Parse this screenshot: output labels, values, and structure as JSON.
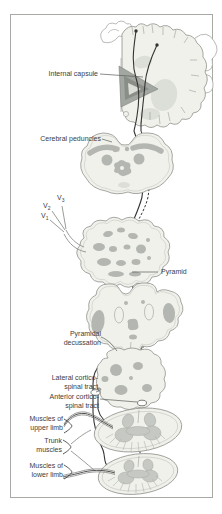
{
  "labels": {
    "internal_capsule": "Internal capsule",
    "cerebral_peduncles": "Cerebral peduncles",
    "pyramid": "Pyramid",
    "pyramidal_decussation": [
      "Pyramidal",
      "decussation"
    ],
    "lateral_corticospinal_tract": [
      "Lateral cortico-",
      "spinal tract"
    ],
    "anterior_corticospinal_tract": [
      "Anterior cortico-",
      "spinal tract"
    ],
    "muscles_upper_limb": [
      "Muscles of",
      "upper limb"
    ],
    "trunk_muscles": [
      "Trunk",
      "muscles"
    ],
    "muscles_lower_limb": [
      "Muscles of",
      "lower limb"
    ],
    "trigeminal": {
      "v3": {
        "base": "V",
        "sub": "3"
      },
      "v2": {
        "base": "V",
        "sub": "2"
      },
      "v1": {
        "base": "V",
        "sub": "1"
      }
    }
  },
  "colors": {
    "background": "#ffffff",
    "frame_border": "#a6a9a4",
    "section_fill": "#f1f1ec",
    "section_outline": "#8f928c",
    "nucleus_gray": "#b4b7b1",
    "nucleus_light": "#dcded8",
    "capsule_gray": "#a3a7a1",
    "capsule_dark": "#8a8e88",
    "tract_line": "#333333",
    "nerve_gray": "#8e918c",
    "leader_line": "#5a5d58",
    "label_text": "#3d3d3d"
  }
}
